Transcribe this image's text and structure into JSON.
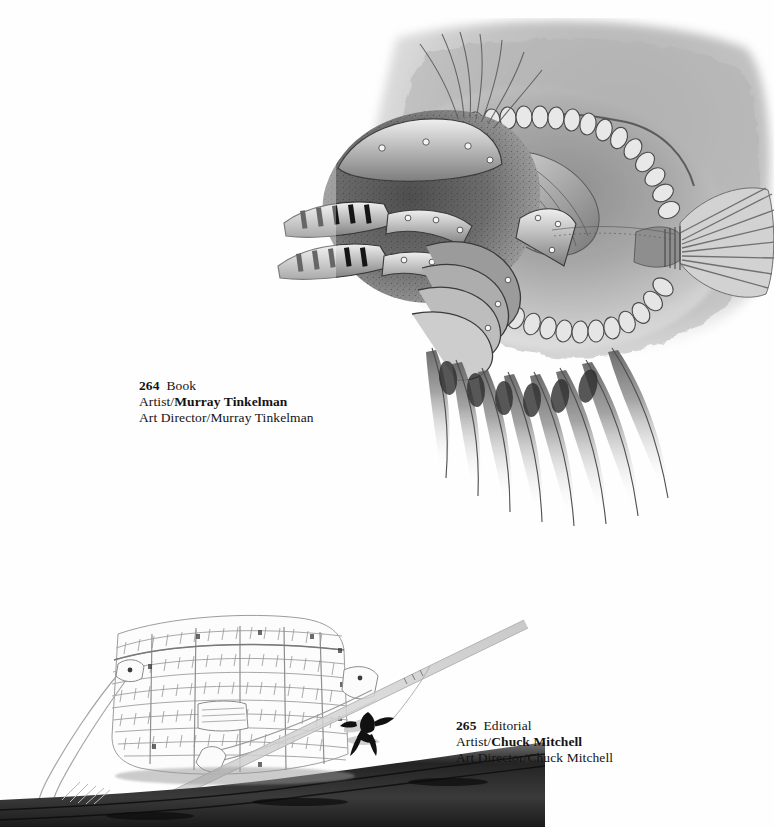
{
  "page": {
    "background_color": "#ffffff",
    "type": "illustration-annual-page",
    "ink_color": "#131313"
  },
  "plates": [
    {
      "number": "264",
      "category": "Book",
      "artist_label": "Artist/",
      "artist_name": "Murray Tinkelman",
      "art_director_label": "Art Director/",
      "art_director_name": "Murray Tinkelman",
      "artwork_name": "armored-fish-illustration",
      "artwork_description": "Pen-and-ink and wash drawing of a fish whose head is rendered as a riveted medieval armor helmet with slotted visor plates, spiny dorsal and ventral rows, long trailing fin rays, and a fan-shaped tail.",
      "medium_tone": "#6e6e6e"
    },
    {
      "number": "265",
      "category": "Editorial",
      "artist_label": "Artist/",
      "artist_name": "Chuck Mitchell",
      "art_director_label": "Art Director/",
      "art_director_name": "Chuck Mitchell",
      "artwork_name": "fishing-creel-illustration",
      "artwork_description": "Light pencil and watercolor drawing of a wicker fishing creel with leather shoulder strap resting on a dark log, a fly rod angled across it, and a dark artificial fly suspended on the leader.",
      "medium_tone": "#b9b9b9"
    }
  ],
  "colors": {
    "paper": "#ffffff",
    "text": "#131313",
    "wash_dark": "#5a5a5a",
    "wash_mid": "#9a9a9a",
    "wash_light": "#cfcfcf",
    "log_dark": "#2a2a2a"
  }
}
